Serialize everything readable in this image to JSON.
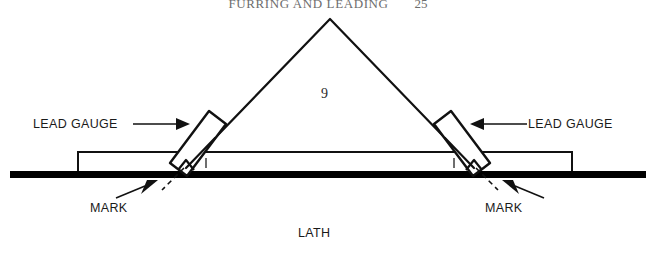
{
  "page": {
    "width": 656,
    "height": 258,
    "background": "#ffffff",
    "ink": "#000000"
  },
  "header": {
    "running_head": "FURRING AND LEADING",
    "folio": "25"
  },
  "diagram": {
    "title": "LATH",
    "apex_value": "9",
    "labels": {
      "lead_gauge_left": "LEAD GAUGE",
      "lead_gauge_right": "LEAD GAUGE",
      "mark_left": "MARK",
      "mark_right": "MARK",
      "lath": "LATH"
    },
    "tick_marks": {
      "left": "i",
      "right": "i"
    },
    "geometry": {
      "apex": [
        330,
        19
      ],
      "left_foot": [
        186,
        168
      ],
      "right_foot": [
        474,
        168
      ],
      "lath_rect": [
        78,
        152,
        494,
        20
      ],
      "baseline_bar": [
        10,
        172,
        636,
        7
      ]
    }
  }
}
